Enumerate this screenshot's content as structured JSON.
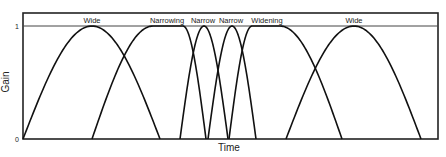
{
  "chart_data": {
    "type": "line",
    "title": "",
    "xlabel": "Time",
    "ylabel": "Gain",
    "ylim": [
      0,
      1
    ],
    "yticks": [
      "0",
      "1"
    ],
    "grid": false,
    "legend": null,
    "segment_labels": [
      {
        "label": "Wide",
        "x": 92
      },
      {
        "label": "Narrowing",
        "x": 167
      },
      {
        "label": "Narrow",
        "x": 203
      },
      {
        "label": "Narrow",
        "x": 231
      },
      {
        "label": "Widening",
        "x": 267
      },
      {
        "label": "Wide",
        "x": 354
      }
    ],
    "series": [
      {
        "name": "Wide",
        "shape": "bump",
        "start": 23,
        "peak_start": 92,
        "peak_end": 92,
        "end": 160
      },
      {
        "name": "Narrowing",
        "shape": "plateau",
        "start": 92,
        "peak_start": 153,
        "peak_end": 183,
        "end": 206
      },
      {
        "name": "Narrow",
        "shape": "bump",
        "start": 180,
        "peak_start": 204,
        "peak_end": 204,
        "end": 228
      },
      {
        "name": "Narrow",
        "shape": "bump",
        "start": 208,
        "peak_start": 232,
        "peak_end": 232,
        "end": 256
      },
      {
        "name": "Widening",
        "shape": "plateau",
        "start": 229,
        "peak_start": 252,
        "peak_end": 280,
        "end": 342
      },
      {
        "name": "Wide",
        "shape": "bump",
        "start": 286,
        "peak_start": 354,
        "peak_end": 354,
        "end": 421
      }
    ],
    "plot_area": {
      "left": 23,
      "right": 438,
      "top": 13,
      "gain1_y": 26,
      "gain0_y": 139
    }
  }
}
